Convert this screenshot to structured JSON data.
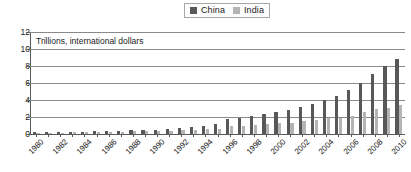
{
  "legend": {
    "position": "top-center",
    "entries": [
      {
        "label": "China",
        "color": "#585858",
        "swatch_name": "legend-swatch-china"
      },
      {
        "label": "India",
        "color": "#b4b4b4",
        "swatch_name": "legend-swatch-india"
      }
    ]
  },
  "axis": {
    "y_ticks": [
      "0",
      "2",
      "4",
      "6",
      "8",
      "10",
      "12"
    ],
    "x_labels": [
      "1980",
      "1982",
      "1984",
      "1986",
      "1988",
      "1990",
      "1992",
      "1994",
      "1996",
      "1998",
      "2000",
      "2002",
      "2004",
      "2006",
      "2008",
      "2010"
    ]
  },
  "subtitle": "Trillions, international dollars",
  "chart_data": {
    "type": "bar",
    "title": "",
    "subtitle": "Trillions, international dollars",
    "xlabel": "",
    "ylabel": "",
    "ylim": [
      0,
      12
    ],
    "ytick_step": 2,
    "grid": true,
    "legend_position": "top-center",
    "categories": [
      "1980",
      "1981",
      "1982",
      "1983",
      "1984",
      "1985",
      "1986",
      "1987",
      "1988",
      "1989",
      "1990",
      "1991",
      "1992",
      "1993",
      "1994",
      "1995",
      "1996",
      "1997",
      "1998",
      "1999",
      "2000",
      "2001",
      "2002",
      "2003",
      "2004",
      "2005",
      "2006",
      "2007",
      "2008",
      "2009",
      "2010"
    ],
    "series": [
      {
        "name": "China",
        "color": "#585858",
        "values": [
          0.13,
          0.15,
          0.17,
          0.19,
          0.23,
          0.27,
          0.3,
          0.34,
          0.39,
          0.42,
          0.45,
          0.51,
          0.59,
          0.68,
          0.78,
          0.88,
          0.99,
          1.1,
          1.2,
          1.3,
          1.43,
          1.57,
          1.73,
          1.93,
          2.16,
          2.43,
          2.77,
          3.15,
          3.47,
          3.75,
          4.1
        ]
      },
      {
        "name": "India",
        "color": "#b4b4b4",
        "values": [
          0.1,
          0.11,
          0.12,
          0.13,
          0.14,
          0.15,
          0.16,
          0.17,
          0.19,
          0.21,
          0.22,
          0.23,
          0.25,
          0.27,
          0.29,
          0.32,
          0.35,
          0.37,
          0.4,
          0.44,
          0.46,
          0.49,
          0.51,
          0.56,
          0.62,
          0.69,
          0.77,
          0.86,
          0.92,
          1.0,
          1.1
        ]
      }
    ],
    "series_plotted": [
      {
        "name": "China",
        "values": [
          0.2,
          0.22,
          0.24,
          0.26,
          0.28,
          0.32,
          0.36,
          0.4,
          0.45,
          0.48,
          0.52,
          0.58,
          0.68,
          0.8,
          0.95,
          1.15,
          1.75,
          1.9,
          2.15,
          2.35,
          2.6,
          2.8,
          3.15,
          3.55,
          4.0,
          4.5,
          5.15,
          6.05,
          7.1,
          8.0,
          8.85
        ]
      },
      {
        "name": "India",
        "values": [
          0.15,
          0.16,
          0.17,
          0.18,
          0.2,
          0.22,
          0.24,
          0.26,
          0.3,
          0.32,
          0.35,
          0.38,
          0.42,
          0.48,
          0.55,
          0.62,
          0.9,
          0.95,
          1.1,
          1.2,
          1.3,
          1.35,
          1.5,
          1.6,
          1.85,
          1.9,
          2.15,
          2.55,
          2.9,
          3.1,
          3.4
        ]
      }
    ]
  }
}
